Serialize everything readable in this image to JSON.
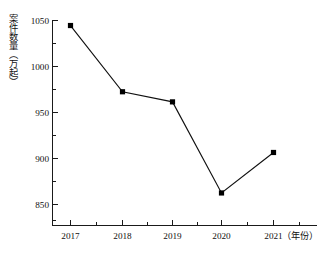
{
  "chart_data": {
    "type": "line",
    "title": "",
    "subtitle": "",
    "xlabel": "（年份）",
    "ylabel": "案件数量（万起）",
    "categories": [
      "2017",
      "2018",
      "2019",
      "2020",
      "2021"
    ],
    "values": [
      1044,
      972,
      961,
      862,
      906
    ],
    "series": [
      {
        "name": "案件数量",
        "values": [
          1044,
          972,
          961,
          862,
          906
        ]
      }
    ],
    "ylim": [
      830,
      1060
    ],
    "y_major_ticks": [
      850,
      900,
      950,
      1000,
      1050
    ],
    "y_tick_labels": [
      "850",
      "900",
      "950",
      "1000",
      "1050"
    ],
    "y_minor_tick_step": 25,
    "x_tick_labels": [
      "2017",
      "2018",
      "2019",
      "2020",
      "2021"
    ],
    "grid": false,
    "legend": false,
    "legend_position": "none",
    "marker": "square",
    "line_color": "#111111",
    "marker_color": "#000000",
    "axis_color": "#1a1a1a",
    "background_color": "#ffffff"
  },
  "axes": {
    "y_title": "案件数量（万起）",
    "x_caption": "（年份）",
    "y_labels": [
      "1050",
      "1000",
      "950",
      "900",
      "850"
    ],
    "x_labels": [
      "2017",
      "2018",
      "2019",
      "2020",
      "2021"
    ]
  }
}
